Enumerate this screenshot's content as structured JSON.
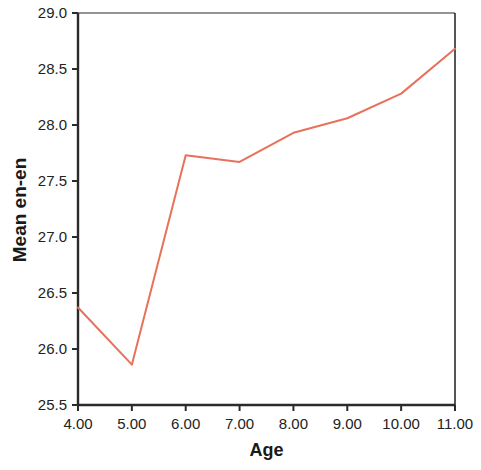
{
  "chart_data": {
    "type": "line",
    "title": "",
    "xlabel": "Age",
    "ylabel": "Mean en-en",
    "x": [
      4,
      5,
      6,
      7,
      8,
      9,
      10,
      11
    ],
    "values": [
      26.37,
      25.86,
      27.73,
      27.67,
      27.93,
      28.06,
      28.28,
      28.68
    ],
    "series": [
      {
        "name": "Mean en-en",
        "values": [
          26.37,
          25.86,
          27.73,
          27.67,
          27.93,
          28.06,
          28.28,
          28.68
        ],
        "color": "#E8715C"
      }
    ],
    "xtick_labels": [
      "4.00",
      "5.00",
      "6.00",
      "7.00",
      "8.00",
      "9.00",
      "10.00",
      "11.00"
    ],
    "xtick_values": [
      4,
      5,
      6,
      7,
      8,
      9,
      10,
      11
    ],
    "ytick_labels": [
      "29.0",
      "28.5",
      "28.0",
      "27.5",
      "27.0",
      "26.5",
      "26.0",
      "25.5"
    ],
    "ytick_values": [
      29.0,
      28.5,
      28.0,
      27.5,
      27.0,
      26.5,
      26.0,
      25.5
    ],
    "xlim": [
      4,
      11
    ],
    "ylim": [
      25.5,
      29.0
    ],
    "grid": false,
    "legend": false,
    "line_color": "#E8715C",
    "axis_color": "#2b2b2b",
    "background": "#ffffff"
  }
}
